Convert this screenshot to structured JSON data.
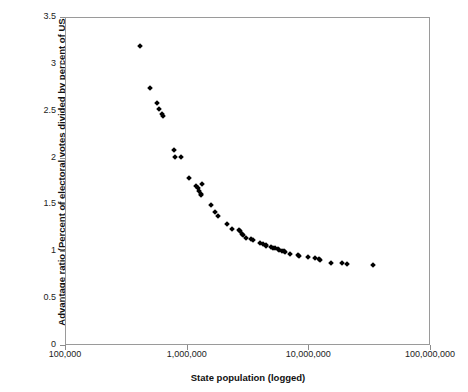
{
  "chart_data": {
    "type": "scatter",
    "title": "",
    "xlabel": "State population (logged)",
    "ylabel": "Advantage ratio (Percent of electoral votes divided by percent of US population)",
    "xscale": "log",
    "yscale": "linear",
    "xlim": [
      100000,
      100000000
    ],
    "ylim": [
      0,
      3.5
    ],
    "grid": false,
    "legend": null,
    "xticks": [
      100000,
      1000000,
      10000000,
      100000000
    ],
    "xtick_labels": [
      "100,000",
      "1,000,000",
      "10,000,000",
      "100,000,000"
    ],
    "yticks": [
      0,
      0.5,
      1,
      1.5,
      2,
      2.5,
      3,
      3.5
    ],
    "ytick_labels": [
      "0",
      "0.5",
      "1",
      "1.5",
      "2",
      "2.5",
      "3",
      "3.5"
    ],
    "marker": "diamond",
    "marker_color": "#000000",
    "n_points": 51,
    "x": [
      413000,
      495000,
      567000,
      594000,
      626000,
      643000,
      783000,
      805000,
      905000,
      1050000,
      1190000,
      1230000,
      1270000,
      1300000,
      1320000,
      1340000,
      1590000,
      1710000,
      1820000,
      2130000,
      2350000,
      2690000,
      2730000,
      2860000,
      2930000,
      3050000,
      3410000,
      3500000,
      4040000,
      4240000,
      4450000,
      4470000,
      4920000,
      5130000,
      5300000,
      5600000,
      5690000,
      6080000,
      6350000,
      6470000,
      7080000,
      8180000,
      8420000,
      9940000,
      11400000,
      12300000,
      12400000,
      15300000,
      18900000,
      20900000,
      33900000
    ],
    "y": [
      3.19,
      2.74,
      2.58,
      2.52,
      2.46,
      2.44,
      2.08,
      2.01,
      2.01,
      1.78,
      1.7,
      1.67,
      1.64,
      1.61,
      1.6,
      1.72,
      1.49,
      1.42,
      1.38,
      1.29,
      1.24,
      1.23,
      1.22,
      1.18,
      1.17,
      1.14,
      1.13,
      1.12,
      1.09,
      1.08,
      1.07,
      1.06,
      1.05,
      1.04,
      1.03,
      1.02,
      1.01,
      1.0,
      1.0,
      0.99,
      0.97,
      0.96,
      0.95,
      0.94,
      0.93,
      0.92,
      0.91,
      0.88,
      0.87,
      0.86,
      0.85
    ]
  },
  "axes": {
    "xlabel": "State population (logged)",
    "ylabel": "Advantage ratio (Percent of electoral votes divided by percent of US population)"
  }
}
